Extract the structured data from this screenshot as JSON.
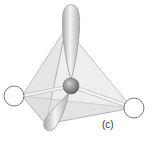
{
  "figure": {
    "label": "(c)",
    "colors": {
      "background": "#ffffff",
      "tetra_face": "#e6e6e6",
      "tetra_edge": "#9a9a9a",
      "central_atom": "#8a8a8a",
      "lobe": "#d8d8d8",
      "bonded_atom_outline": "#7a7a7a"
    },
    "elements": {
      "central_atom": "central-atom",
      "lone_pair_lobes": 2,
      "bonded_atoms": 2
    }
  }
}
